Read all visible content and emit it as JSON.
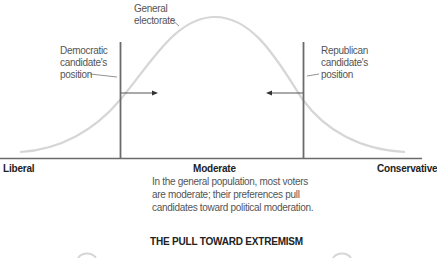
{
  "diagram": {
    "labels": {
      "general_line1": "General",
      "general_line2": "electorate",
      "dem_line1": "Democratic",
      "dem_line2": "candidate's",
      "dem_line3": "position",
      "rep_line1": "Republican",
      "rep_line2": "candidate's",
      "rep_line3": "position"
    },
    "axis": {
      "left": "Liberal",
      "center": "Moderate",
      "right": "Conservative"
    },
    "caption": {
      "line1": "In the general population, most voters",
      "line2": "are moderate; their preferences pull",
      "line3": "candidates toward political moderation."
    },
    "next_section_title": "THE PULL TOWARD EXTREMISM",
    "colors": {
      "curve": "#d4d4d4",
      "lines": "#6b6b6b",
      "text": "#555555",
      "bold_text": "#222222"
    }
  }
}
